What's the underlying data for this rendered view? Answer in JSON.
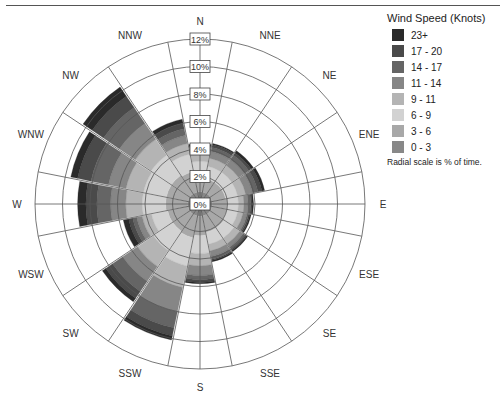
{
  "chart_data": {
    "type": "wind-rose",
    "title": "",
    "legend_title": "Wind Speed (Knots)",
    "legend_note": "Radial scale is % of time.",
    "radial_ticks": [
      "0%",
      "2%",
      "4%",
      "6%",
      "8%",
      "10%",
      "12%"
    ],
    "radial_max": 12,
    "directions": [
      "N",
      "NNE",
      "NE",
      "ENE",
      "E",
      "ESE",
      "SE",
      "SSE",
      "S",
      "SSW",
      "SW",
      "WSW",
      "W",
      "WNW",
      "NW",
      "NNW"
    ],
    "speed_bins": [
      {
        "label": "0 - 3",
        "color": "#888888"
      },
      {
        "label": "3 - 6",
        "color": "#a8a8a8"
      },
      {
        "label": "6 - 9",
        "color": "#d2d2d2"
      },
      {
        "label": "9 - 11",
        "color": "#b4b4b4"
      },
      {
        "label": "11 - 14",
        "color": "#868686"
      },
      {
        "label": "14 - 17",
        "color": "#656565"
      },
      {
        "label": "17 - 20",
        "color": "#4a4a4a"
      },
      {
        "label": "23+",
        "color": "#2a2a2a"
      }
    ],
    "legend_order": [
      "23+",
      "17 - 20",
      "14 - 17",
      "11 - 14",
      "9 - 11",
      "6 - 9",
      "3 - 6",
      "0 - 3"
    ],
    "series": [
      {
        "name": "0 - 3",
        "values": [
          0.9,
          0.9,
          0.9,
          0.9,
          0.9,
          0.9,
          0.9,
          0.9,
          0.9,
          0.9,
          0.9,
          0.9,
          0.9,
          0.9,
          0.9,
          0.9
        ]
      },
      {
        "name": "3 - 6",
        "values": [
          1.2,
          1.0,
          1.0,
          1.0,
          1.1,
          1.1,
          1.2,
          1.2,
          1.4,
          1.6,
          1.5,
          1.5,
          1.6,
          1.6,
          1.6,
          1.5
        ]
      },
      {
        "name": "6 - 9",
        "values": [
          1.0,
          0.9,
          0.9,
          0.9,
          0.8,
          0.8,
          0.9,
          0.9,
          1.3,
          2.1,
          1.7,
          1.2,
          1.7,
          1.7,
          1.8,
          1.3
        ]
      },
      {
        "name": "9 - 11",
        "values": [
          0.5,
          0.6,
          0.6,
          0.6,
          0.4,
          0.4,
          0.5,
          0.5,
          0.9,
          1.6,
          1.4,
          0.7,
          1.2,
          1.3,
          1.4,
          0.8
        ]
      },
      {
        "name": "11 - 14",
        "values": [
          0.4,
          0.5,
          0.5,
          0.5,
          0.3,
          0.3,
          0.3,
          0.4,
          0.7,
          1.8,
          1.3,
          0.4,
          1.1,
          1.3,
          1.4,
          0.6
        ]
      },
      {
        "name": "14 - 17",
        "values": [
          0.2,
          0.3,
          0.4,
          0.4,
          0.2,
          0.1,
          0.2,
          0.2,
          0.3,
          1.2,
          0.9,
          0.3,
          1.0,
          1.3,
          1.4,
          0.5
        ]
      },
      {
        "name": "17 - 20",
        "values": [
          0.1,
          0.2,
          0.2,
          0.3,
          0.1,
          0.1,
          0.1,
          0.1,
          0.2,
          0.6,
          0.6,
          0.3,
          0.8,
          1.0,
          1.0,
          0.4
        ]
      },
      {
        "name": "23+",
        "values": [
          0.1,
          0.1,
          0.2,
          0.2,
          0.1,
          0.1,
          0.1,
          0.1,
          0.1,
          0.3,
          0.3,
          0.4,
          0.6,
          0.5,
          0.8,
          0.3
        ]
      }
    ],
    "totals": [
      4.4,
      4.5,
      4.7,
      4.8,
      3.9,
      3.8,
      4.2,
      4.3,
      5.8,
      10.1,
      8.6,
      5.7,
      8.9,
      9.6,
      10.3,
      6.3
    ],
    "grid": true,
    "legend_position": "right"
  }
}
